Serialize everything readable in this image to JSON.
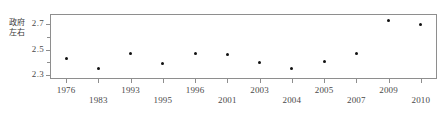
{
  "chart_data": {
    "type": "scatter",
    "title": "",
    "xlabel": "",
    "ylabel": "政府左右",
    "categories": [
      "1976",
      "1983",
      "1993",
      "1995",
      "1996",
      "2001",
      "2003",
      "2004",
      "2005",
      "2007",
      "2009",
      "2010"
    ],
    "values": [
      2.43,
      2.35,
      2.47,
      2.39,
      2.47,
      2.46,
      2.4,
      2.35,
      2.41,
      2.47,
      2.73,
      2.7
    ],
    "ylim": [
      2.27,
      2.78
    ],
    "ytick_labels": [
      "2.7",
      "2.5",
      "2.3"
    ],
    "ytick_values": [
      2.7,
      2.5,
      2.3
    ],
    "yminor_ticks": [
      2.6,
      2.4
    ],
    "grid": false,
    "legend": null,
    "marker": "filled-circle",
    "marker_color": "#111111"
  },
  "axes": {
    "frame_color": "#8e8e8e",
    "tick_color": "#8e8e8e",
    "label_color": "#4a4a4a"
  }
}
